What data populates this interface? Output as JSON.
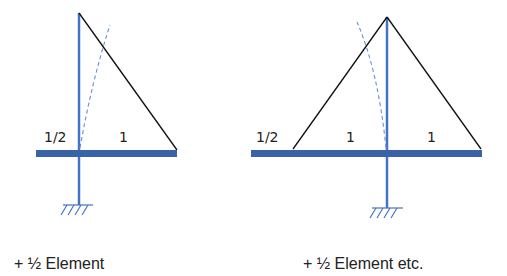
{
  "diagrams": [
    {
      "name": "half-element",
      "labels": {
        "left": "1/2",
        "right": "1"
      },
      "caption": "+ ½ Element"
    },
    {
      "name": "half-element-etc",
      "labels": {
        "left": "1/2",
        "middle": "1",
        "right": "1"
      },
      "caption": "+ ½ Element etc."
    }
  ],
  "colors": {
    "member": "#4472c4",
    "beam": "#3a62a8",
    "line": "#111111",
    "dashed": "#6b8fd0"
  }
}
